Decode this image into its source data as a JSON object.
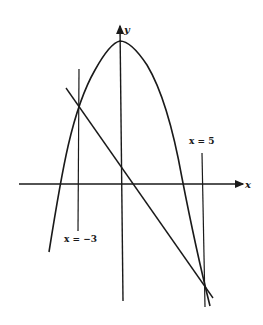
{
  "diagram": {
    "axes": {
      "x_label": "x",
      "y_label": "y"
    },
    "vertical_lines": [
      {
        "label": "x = −3",
        "x_value": -3
      },
      {
        "label": "x = 5",
        "x_value": 5
      }
    ],
    "curves": [
      {
        "type": "parabola",
        "opens": "down"
      },
      {
        "type": "line",
        "slope": "negative"
      }
    ],
    "colors": {
      "ink": "#1a1a1a",
      "background": "#ffffff"
    }
  }
}
